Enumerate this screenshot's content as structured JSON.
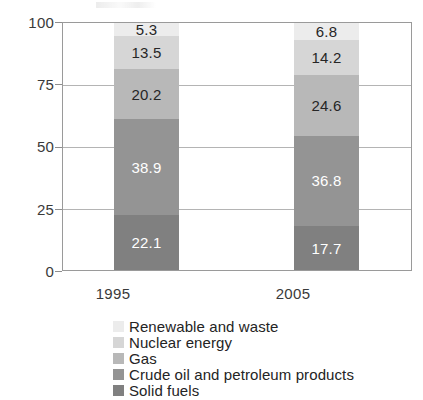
{
  "chart_data": {
    "type": "bar",
    "stacked": true,
    "title": "",
    "subtitle": "",
    "xlabel": "",
    "ylabel": "",
    "categories": [
      "1995",
      "2005"
    ],
    "ylim": [
      0,
      100
    ],
    "yticks": [
      "0",
      "25",
      "50",
      "75",
      "100"
    ],
    "grid": true,
    "legend_position": "bottom-left",
    "stack_order": "bottom-to-top",
    "series": [
      {
        "name": "Solid fuels",
        "color": "#808080",
        "label_color": "#ffffff",
        "values": [
          22.1,
          17.7
        ],
        "labels": [
          "22.1",
          "17.7"
        ]
      },
      {
        "name": "Crude oil and petroleum products",
        "color": "#949494",
        "label_color": "#ffffff",
        "values": [
          38.9,
          36.8
        ],
        "labels": [
          "38.9",
          "36.8"
        ]
      },
      {
        "name": "Gas",
        "color": "#b8b8b8",
        "label_color": "#262626",
        "values": [
          20.2,
          24.6
        ],
        "labels": [
          "20.2",
          "24.6"
        ]
      },
      {
        "name": "Nuclear energy",
        "color": "#d6d6d6",
        "label_color": "#262626",
        "values": [
          13.5,
          14.2
        ],
        "labels": [
          "13.5",
          "14.2"
        ]
      },
      {
        "name": "Renewable and waste",
        "color": "#ececec",
        "label_color": "#262626",
        "values": [
          5.3,
          6.8
        ],
        "labels": [
          "5.3",
          "6.8"
        ]
      }
    ],
    "legend_entries": [
      "Renewable and waste",
      "Nuclear energy",
      "Gas",
      "Crude oil and petroleum products",
      "Solid fuels"
    ]
  }
}
